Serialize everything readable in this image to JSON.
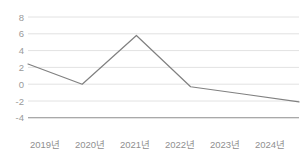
{
  "chart_data": {
    "type": "line",
    "title": "",
    "subtitle": "",
    "xlabel": "",
    "ylabel": "",
    "categories": [
      "2019년",
      "2020년",
      "2021년",
      "2022년",
      "2023년",
      "2024년"
    ],
    "series": [
      {
        "name": "",
        "values": [
          2.4,
          0.0,
          5.8,
          -0.3,
          -1.2,
          -2.1
        ]
      }
    ],
    "ylim": [
      -4,
      8
    ],
    "yticks": [
      8,
      6,
      4,
      2,
      0,
      -2,
      -4
    ],
    "ytick_labels": [
      "8",
      "6",
      "4",
      "2",
      "0",
      "-2",
      "-4"
    ],
    "xtick_labels": [
      "2019년",
      "2020년",
      "2021년",
      "2022년",
      "2023년",
      "2024년"
    ],
    "grid": true,
    "grid_axis": "y",
    "legend": false,
    "legend_position": "none",
    "markers": false,
    "annotations": []
  },
  "style": {
    "line_color": "#808080",
    "grid_color": "#e2e2e2",
    "axis_color": "#8c8c8c",
    "tick_text_color": "#919191",
    "background": "#ffffff"
  }
}
